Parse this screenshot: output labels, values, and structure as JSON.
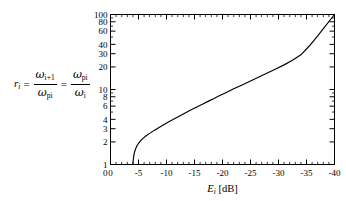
{
  "figure": {
    "background_color": "#ffffff",
    "line_color": "#000000",
    "frame_color": "#000000"
  },
  "equation": {
    "lhs": "r",
    "lhs_sub": "i",
    "eq1": "=",
    "f1_num_sym": "ω",
    "f1_num_sub": "i+1",
    "f1_den_sym": "ω",
    "f1_den_sub": "pi",
    "eq2": "=",
    "f2_num_sym": "ω",
    "f2_num_sub": "pi",
    "f2_den_sym": "ω",
    "f2_den_sub": "i"
  },
  "chart_data": {
    "type": "line",
    "title": "",
    "subtitle": "",
    "xlabel": "E_i [dB]",
    "xlabel_parts": {
      "symbol": "E",
      "sub": "i",
      "unit": "[dB]"
    },
    "ylabel": "",
    "xlim": [
      0,
      -40
    ],
    "ylim": [
      1,
      100
    ],
    "yscale": "log",
    "xscale": "linear",
    "grid": false,
    "legend": null,
    "xticks": [
      0,
      -5,
      -10,
      -15,
      -20,
      -25,
      -30,
      -35,
      -40
    ],
    "xticklabels": [
      "0",
      "-5",
      "-10",
      "-15",
      "-20",
      "-25",
      "-30",
      "-35",
      "-40"
    ],
    "yticks": [
      1,
      2,
      3,
      4,
      6,
      8,
      10,
      20,
      30,
      40,
      60,
      80,
      100
    ],
    "yticklabels": [
      "1",
      "2",
      "3",
      "4",
      "6",
      "8",
      "10",
      "20",
      "30",
      "40",
      "60",
      "80",
      "100"
    ],
    "extra_axis_label": "0",
    "series": [
      {
        "name": "r_i vs E_i",
        "x": [
          -4.0,
          -4.05,
          -4.15,
          -4.3,
          -4.5,
          -4.8,
          -5.2,
          -5.7,
          -6.3,
          -7.0,
          -7.8,
          -8.6,
          -9.5,
          -10.5,
          -11.5,
          -12.5,
          -13.5,
          -14.5,
          -15.5,
          -16.5,
          -17.5,
          -18.5,
          -19.5,
          -20.5,
          -22.0,
          -23.5,
          -25.0,
          -26.5,
          -28.0,
          -29.5,
          -31.0,
          -32.5,
          -34.0,
          -35.5,
          -37.0,
          -38.5,
          -40.0
        ],
        "y": [
          1.0,
          1.12,
          1.3,
          1.47,
          1.63,
          1.82,
          2.0,
          2.2,
          2.4,
          2.6,
          2.85,
          3.1,
          3.4,
          3.75,
          4.1,
          4.5,
          4.95,
          5.4,
          5.9,
          6.4,
          7.0,
          7.6,
          8.3,
          9.0,
          10.2,
          11.5,
          13.0,
          14.7,
          16.6,
          18.8,
          21.3,
          24.5,
          29.0,
          38.0,
          52.0,
          72.0,
          100.0
        ]
      }
    ]
  }
}
